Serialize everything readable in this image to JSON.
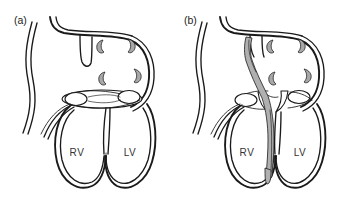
{
  "figure": {
    "type": "anatomical-line-diagram",
    "background_color": "#ffffff",
    "ink_color": "#1a1a1a",
    "shading_color": "#a8a8a8",
    "width": 340,
    "height": 203
  },
  "panels": [
    {
      "id": "a",
      "label": "(a)",
      "label_x": 14,
      "label_y": 24,
      "state": "valve-closed",
      "chambers": [
        {
          "name": "right-ventricle",
          "label": "RV",
          "x": 77,
          "y": 152
        },
        {
          "name": "left-ventricle",
          "label": "LV",
          "x": 130,
          "y": 152
        }
      ],
      "cusps": [
        {
          "x": 101,
          "y": 46,
          "flip": false
        },
        {
          "x": 131,
          "y": 45,
          "flip": true
        },
        {
          "x": 103,
          "y": 78,
          "flip": false
        },
        {
          "x": 137,
          "y": 75,
          "flip": true
        }
      ]
    },
    {
      "id": "b",
      "label": "(b)",
      "label_x": 184,
      "label_y": 24,
      "state": "valve-open-with-lead",
      "chambers": [
        {
          "name": "right-ventricle",
          "label": "RV",
          "x": 247,
          "y": 152
        },
        {
          "name": "left-ventricle",
          "label": "LV",
          "x": 300,
          "y": 152
        }
      ],
      "cusps": [
        {
          "x": 271,
          "y": 46,
          "flip": false
        },
        {
          "x": 301,
          "y": 45,
          "flip": true
        },
        {
          "x": 273,
          "y": 78,
          "flip": false
        },
        {
          "x": 307,
          "y": 75,
          "flip": true
        }
      ]
    }
  ],
  "annotations": {
    "vessel_name": "descending-vessel",
    "lead_name": "transvalvular-lead"
  }
}
